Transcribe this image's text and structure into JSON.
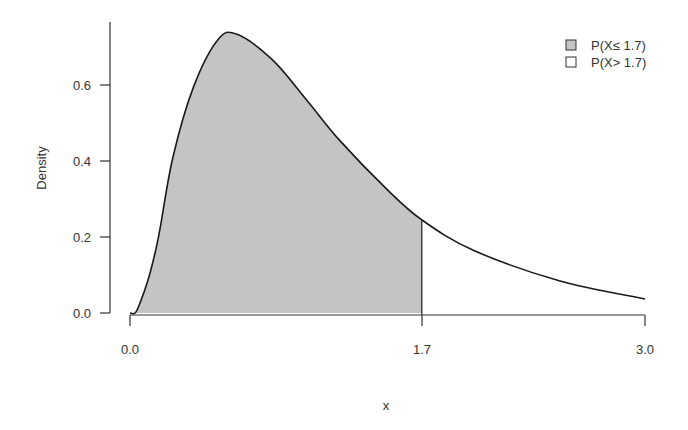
{
  "chart_data": {
    "type": "area",
    "title": "",
    "xlabel": "x",
    "ylabel": "Density",
    "xlim": [
      0,
      3
    ],
    "ylim": [
      0,
      0.75
    ],
    "x_ticks": [
      "0.0",
      "1.7",
      "3.0"
    ],
    "y_ticks": [
      "0.0",
      "0.2",
      "0.4",
      "0.6"
    ],
    "grid": false,
    "legend_position": "top-right",
    "threshold": 1.7,
    "legend": [
      {
        "label": "P(X≤ 1.7)",
        "fill": "#c4c4c4"
      },
      {
        "label": "P(X> 1.7)",
        "fill": "#ffffff"
      }
    ],
    "series": [
      {
        "name": "density",
        "x": [
          0.0,
          0.03,
          0.058,
          0.105,
          0.146,
          0.175,
          0.25,
          0.37,
          0.51,
          0.62,
          0.83,
          1.03,
          1.22,
          1.5,
          1.7,
          2.0,
          2.5,
          3.0
        ],
        "values": [
          0.0,
          0.0,
          0.026,
          0.087,
          0.158,
          0.222,
          0.41,
          0.595,
          0.718,
          0.734,
          0.666,
          0.56,
          0.455,
          0.324,
          0.245,
          0.165,
          0.085,
          0.037
        ]
      }
    ]
  },
  "axes": {
    "xlabel": "x",
    "ylabel": "Density",
    "x_tick_labels": [
      "0.0",
      "1.7",
      "3.0"
    ],
    "y_tick_labels": [
      "0.0",
      "0.2",
      "0.4",
      "0.6"
    ]
  },
  "legend": {
    "items": [
      {
        "label": "P(X≤ 1.7)"
      },
      {
        "label": "P(X> 1.7)"
      }
    ]
  },
  "colors": {
    "shaded": "#c4c4c4",
    "unshaded": "#ffffff",
    "line": "#1a1a1a"
  }
}
